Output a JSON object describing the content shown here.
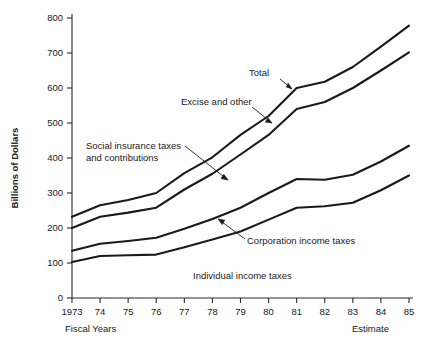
{
  "chart_data": {
    "type": "line",
    "title": "",
    "xlabel": "Fiscal Years",
    "ylabel": "Billions of Dollars",
    "x": [
      1973,
      1974,
      1975,
      1976,
      1977,
      1978,
      1979,
      1980,
      1981,
      1982,
      1983,
      1984,
      1985
    ],
    "xtick_labels": [
      "1973",
      "74",
      "75",
      "76",
      "77",
      "78",
      "79",
      "80",
      "81",
      "82",
      "83",
      "84",
      "85"
    ],
    "ytick_labels": [
      "0",
      "100",
      "200",
      "300",
      "400",
      "500",
      "600",
      "700",
      "800"
    ],
    "ytick_values": [
      0,
      100,
      200,
      300,
      400,
      500,
      600,
      700,
      800
    ],
    "xlim": [
      1973,
      1985
    ],
    "ylim": [
      0,
      800
    ],
    "grid": false,
    "legend": "annotations",
    "series": [
      {
        "name": "Total",
        "values": [
          232,
          265,
          280,
          300,
          357,
          402,
          466,
          520,
          600,
          618,
          660,
          718,
          778
        ]
      },
      {
        "name": "Excise and other",
        "values": [
          200,
          232,
          244,
          258,
          310,
          355,
          410,
          466,
          540,
          560,
          600,
          650,
          702
        ]
      },
      {
        "name": "Social insurance taxes and contributions",
        "values": [
          135,
          155,
          163,
          172,
          198,
          226,
          258,
          300,
          340,
          338,
          352,
          390,
          435
        ]
      },
      {
        "name": "Corporation income taxes",
        "values": [
          103,
          120,
          122,
          124,
          145,
          167,
          190,
          224,
          258,
          262,
          272,
          308,
          350
        ]
      }
    ],
    "annotations": [
      {
        "name": "total",
        "text": "Total",
        "label_x": 249,
        "label_y": 76,
        "leader": "M 280,79 L 292,89",
        "arrow": "M 292,89 L 286.2,87.0 L 288.2,83.2 Z"
      },
      {
        "name": "excise-and-other",
        "text": "Excise and other",
        "label_x": 181,
        "label_y": 105,
        "leader": "M 252,107 L 272,123",
        "arrow": "M 272,123 L 265.4,122.1 L 268.0,117.9 Z"
      },
      {
        "name": "social-insurance",
        "text_line1": "Social insurance taxes",
        "text_line2": "and contributions",
        "label_x": 86,
        "label_y": 149,
        "label_y2": 161,
        "leader": "M 185,146 L 228,180",
        "arrow": "M 228,180 L 221.0,178.6 L 223.8,174.2 Z"
      },
      {
        "name": "corporation-income-taxes",
        "text": "Corporation income taxes",
        "label_x": 247,
        "label_y": 244,
        "leader": "M 245,239 L 218,219",
        "arrow": "M 218,219 L 224.8,220.2 L 222.2,224.6 Z"
      },
      {
        "name": "individual-income-taxes",
        "text": "Individual income taxes",
        "label_x": 193,
        "label_y": 279,
        "leader": "",
        "arrow": ""
      }
    ],
    "footnotes": {
      "left": "Fiscal Years",
      "right": "Estimate"
    }
  }
}
